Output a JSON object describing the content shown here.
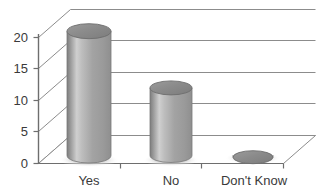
{
  "chart_data": {
    "type": "bar",
    "title": "",
    "subtitle": "",
    "xlabel": "",
    "ylabel": "",
    "categories": [
      "Yes",
      "No",
      "Don't Know"
    ],
    "values": [
      21,
      12,
      1
    ],
    "series": [
      {
        "name": "Responses",
        "values": [
          21,
          12,
          1
        ]
      }
    ],
    "ylim": [
      0,
      20
    ],
    "yticks": [
      0,
      5,
      10,
      15,
      20
    ],
    "ytick_labels": [
      "0",
      "5",
      "10",
      "15",
      "20"
    ],
    "grid": true,
    "grid_axis": "y",
    "legend": false,
    "legend_position": "none",
    "style": "3d-cylinder",
    "annotations": []
  },
  "axes": {
    "y_tick_labels": [
      "20",
      "15",
      "10",
      "5",
      "0"
    ],
    "x_tick_labels": [
      "Yes",
      "No",
      "Don't Know"
    ]
  },
  "colors": {
    "bar_light": "#d4d4d4",
    "bar_mid": "#a8a8a8",
    "bar_dark": "#707070",
    "bar_top": "#8a8a8a",
    "gridline": "#8c8c8c",
    "axis": "#6e6e6e",
    "text": "#3a3a3a",
    "background": "#ffffff",
    "shadow": "#c9c9c9"
  }
}
